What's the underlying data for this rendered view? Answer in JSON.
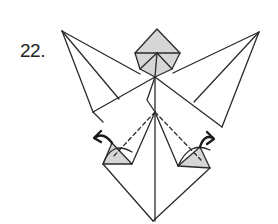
{
  "diagram": {
    "step_label": "22.",
    "type": "origami-folding-step",
    "colors": {
      "line": "#2a2a2a",
      "shade": "#d6d6d6",
      "background": "#ffffff"
    },
    "elements": [
      {
        "name": "top-shaded-square",
        "description": "shaded diamond flap at top center"
      },
      {
        "name": "left-wing-flap",
        "description": "left pointed flap with radiating crease lines"
      },
      {
        "name": "right-wing-flap",
        "description": "right pointed flap with radiating crease lines"
      },
      {
        "name": "left-shaded-triangle",
        "description": "small shaded triangle at lower left with curved arrow"
      },
      {
        "name": "right-shaded-triangle",
        "description": "small shaded triangle at lower right with curved arrow"
      },
      {
        "name": "valley-fold-lines",
        "description": "dashed valley fold lines from center to lower flaps"
      },
      {
        "name": "bottom-point",
        "description": "kite-shaped lower body ending at a point"
      }
    ]
  }
}
